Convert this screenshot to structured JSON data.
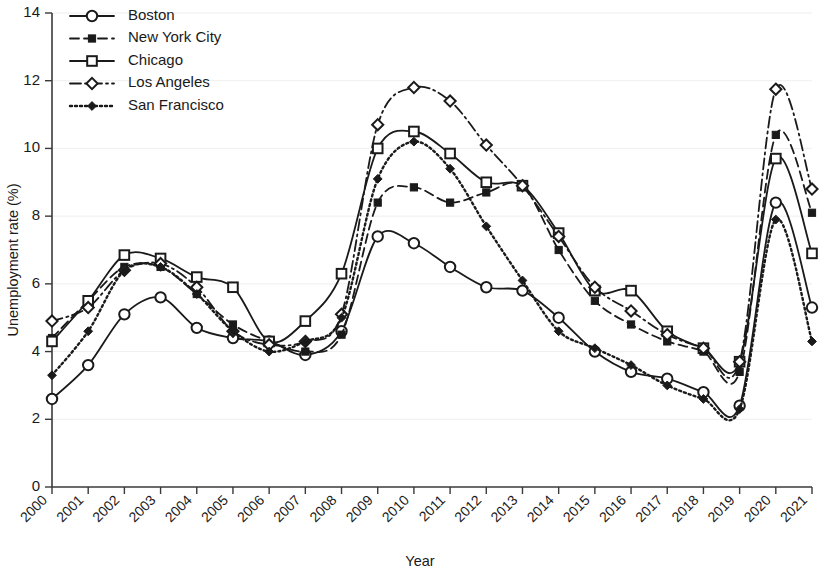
{
  "chart_data": {
    "type": "line",
    "title": "",
    "xlabel": "Year",
    "ylabel": "Unemployment rate (%)",
    "xlim": [
      2000,
      2021
    ],
    "ylim": [
      0,
      14
    ],
    "yticks": [
      0,
      2,
      4,
      6,
      8,
      10,
      12,
      14
    ],
    "grid": false,
    "legend_position": "top-left",
    "categories": [
      "2000",
      "2001",
      "2002",
      "2003",
      "2004",
      "2005",
      "2006",
      "2007",
      "2008",
      "2009",
      "2010",
      "2011",
      "2012",
      "2013",
      "2014",
      "2015",
      "2016",
      "2017",
      "2018",
      "2019",
      "2020",
      "2021"
    ],
    "x": [
      2000,
      2001,
      2002,
      2003,
      2004,
      2005,
      2006,
      2007,
      2008,
      2009,
      2010,
      2011,
      2012,
      2013,
      2014,
      2015,
      2016,
      2017,
      2018,
      2019,
      2020,
      2021
    ],
    "series": [
      {
        "name": "Boston",
        "line_style": "solid",
        "marker": "open-circle",
        "color": "#1a1a1a",
        "values": [
          2.6,
          3.6,
          5.1,
          5.6,
          4.7,
          4.4,
          4.3,
          3.9,
          4.6,
          7.4,
          7.2,
          6.5,
          5.9,
          5.8,
          5.0,
          4.0,
          3.4,
          3.2,
          2.8,
          2.4,
          8.4,
          5.3
        ]
      },
      {
        "name": "New York City",
        "line_style": "dashed",
        "marker": "filled-square",
        "color": "#1a1a1a",
        "values": [
          4.4,
          5.5,
          6.5,
          6.5,
          5.7,
          4.8,
          4.3,
          4.0,
          4.5,
          8.4,
          8.85,
          8.4,
          8.7,
          8.9,
          7.0,
          5.5,
          4.8,
          4.3,
          4.0,
          3.4,
          10.4,
          8.1
        ]
      },
      {
        "name": "Chicago",
        "line_style": "solid",
        "marker": "open-square",
        "color": "#1a1a1a",
        "values": [
          4.3,
          5.5,
          6.85,
          6.75,
          6.2,
          5.9,
          4.3,
          4.9,
          6.3,
          10.0,
          10.5,
          9.85,
          9.0,
          8.9,
          7.5,
          5.8,
          5.8,
          4.6,
          4.1,
          3.7,
          9.7,
          6.9
        ]
      },
      {
        "name": "Los Angeles",
        "line_style": "dash-dot",
        "marker": "open-diamond",
        "color": "#1a1a1a",
        "values": [
          4.9,
          5.3,
          6.4,
          6.6,
          5.9,
          4.6,
          4.2,
          4.3,
          5.1,
          10.7,
          11.8,
          11.4,
          10.1,
          8.9,
          7.4,
          5.9,
          5.2,
          4.5,
          4.1,
          3.7,
          11.75,
          8.8
        ]
      },
      {
        "name": "San Francisco",
        "line_style": "dotted",
        "marker": "filled-diamond",
        "color": "#1a1a1a",
        "values": [
          3.3,
          4.6,
          6.4,
          6.5,
          5.7,
          4.6,
          4.0,
          4.3,
          5.0,
          9.1,
          10.2,
          9.4,
          7.7,
          6.1,
          4.6,
          4.1,
          3.6,
          3.0,
          2.6,
          2.3,
          7.9,
          4.3
        ]
      }
    ]
  },
  "legend": {
    "entries": [
      {
        "label": "Boston"
      },
      {
        "label": "New York City"
      },
      {
        "label": "Chicago"
      },
      {
        "label": "Los Angeles"
      },
      {
        "label": "San Francisco"
      }
    ]
  },
  "axes": {
    "y_title": "Unemployment rate (%)",
    "x_title": "Year"
  }
}
